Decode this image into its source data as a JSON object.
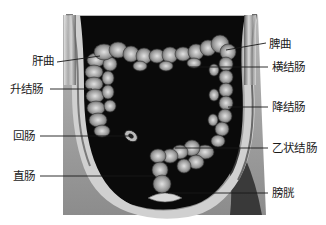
{
  "figure": {
    "colors": {
      "background": "#ffffff",
      "cavity": "#0a0a0a",
      "body_wall": "#9a9a9a",
      "body_wall_light": "#d8d8d8",
      "colon": "#8a8a8a",
      "colon_highlight": "#cfcfcf",
      "leader_line": "#1a1a1a",
      "label_text": "#1a1a1a"
    }
  },
  "labels": {
    "left": [
      {
        "id": "hepatic-flexure",
        "text": "肝曲"
      },
      {
        "id": "ascending-colon",
        "text": "升结肠"
      },
      {
        "id": "ileum",
        "text": "回肠"
      },
      {
        "id": "rectum",
        "text": "直肠"
      }
    ],
    "right": [
      {
        "id": "splenic-flexure",
        "text": "脾曲"
      },
      {
        "id": "transverse-colon",
        "text": "横结肠"
      },
      {
        "id": "descending-colon",
        "text": "降结肠"
      },
      {
        "id": "sigmoid-colon",
        "text": "乙状结肠"
      },
      {
        "id": "bladder",
        "text": "膀胱"
      }
    ]
  }
}
